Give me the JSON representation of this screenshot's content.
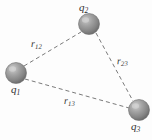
{
  "figure": {
    "background_color": "#fdfdfd",
    "sphere_color": "#8f8f8f",
    "sphere_highlight_color": "#c9c9c9",
    "sphere_shadow_color": "#5e5e5e",
    "line_color": "#7a7a7a",
    "label_color": "#303030"
  },
  "charges": [
    {
      "id": "q1",
      "label_base": "q",
      "label_sub": "1",
      "cx": 16,
      "cy": 73,
      "r": 10.5
    },
    {
      "id": "q2",
      "label_base": "q",
      "label_sub": "2",
      "cx": 89,
      "cy": 24,
      "r": 10.5
    },
    {
      "id": "q3",
      "label_base": "q",
      "label_sub": "3",
      "cx": 139,
      "cy": 110,
      "r": 10.5
    }
  ],
  "distances": [
    {
      "id": "r12",
      "label_base": "r",
      "label_sub": "12",
      "from": "q1",
      "to": "q2"
    },
    {
      "id": "r23",
      "label_base": "r",
      "label_sub": "23",
      "from": "q2",
      "to": "q3"
    },
    {
      "id": "r13",
      "label_base": "r",
      "label_sub": "13",
      "from": "q1",
      "to": "q3"
    }
  ]
}
